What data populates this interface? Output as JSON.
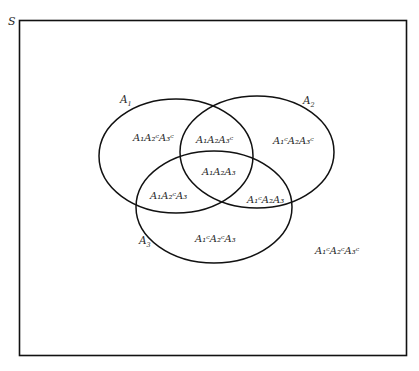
{
  "diagram": {
    "type": "venn",
    "sample_space_label": "S",
    "sets": [
      {
        "name": "A1",
        "base": "A",
        "index": "1"
      },
      {
        "name": "A2",
        "base": "A",
        "index": "2"
      },
      {
        "name": "A3",
        "base": "A",
        "index": "3"
      }
    ],
    "regions": [
      {
        "id": "A1A2cA3c",
        "text": "A₁A₂ᶜA₃ᶜ"
      },
      {
        "id": "A1A2A3c",
        "text": "A₁A₂A₃ᶜ"
      },
      {
        "id": "A1cA2A3c",
        "text": "A₁ᶜA₂A₃ᶜ"
      },
      {
        "id": "A1A2A3",
        "text": "A₁A₂A₃"
      },
      {
        "id": "A1A2cA3",
        "text": "A₁A₂ᶜA₃"
      },
      {
        "id": "A1cA2A3",
        "text": "A₁ᶜA₂A₃"
      },
      {
        "id": "A1cA2cA3",
        "text": "A₁ᶜA₂ᶜA₃"
      },
      {
        "id": "A1cA2cA3c",
        "text": "A₁ᶜA₂ᶜA₃ᶜ"
      }
    ],
    "colors": {
      "stroke": "#111111",
      "text": "#2a2a2a",
      "background": "#ffffff"
    }
  }
}
